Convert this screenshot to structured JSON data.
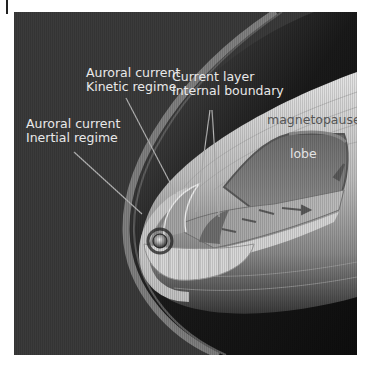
{
  "figure": {
    "colors": {
      "background": "#3b3b3b",
      "label_light": "#e9e9e9",
      "label_dark": "#555555",
      "leader_line": "#b5b5b5"
    }
  },
  "labels": {
    "kinetic": {
      "line1": "Auroral current",
      "line2": "Kinetic regime"
    },
    "inertial": {
      "line1": "Auroral current",
      "line2": "Inertial regime"
    },
    "current_layer": {
      "line1": "Current layer",
      "line2": "Internal boundary"
    },
    "magnetopause": "magnetopause",
    "lobe": "lobe"
  }
}
